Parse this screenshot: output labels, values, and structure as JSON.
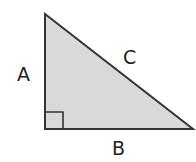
{
  "diagram": {
    "type": "right-triangle",
    "labels": {
      "side_vertical": "A",
      "side_horizontal": "B",
      "hypotenuse": "C"
    },
    "colors": {
      "fill": "#d9d9d9",
      "stroke": "#333333"
    },
    "right_angle_marker": true
  }
}
